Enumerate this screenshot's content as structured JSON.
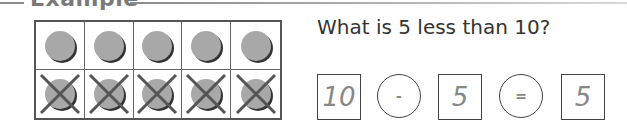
{
  "section": {
    "title": "Example"
  },
  "ten_frame": {
    "top_row": [
      "filled",
      "filled",
      "filled",
      "filled",
      "filled"
    ],
    "bottom_row": [
      "crossed",
      "crossed",
      "crossed",
      "crossed",
      "crossed"
    ],
    "counter_color": "#a8a8a8"
  },
  "question": {
    "text": "What is 5 less than 10?"
  },
  "equation": {
    "operand1": "10",
    "operator": "-",
    "operand2": "5",
    "equals": "=",
    "result": "5"
  }
}
